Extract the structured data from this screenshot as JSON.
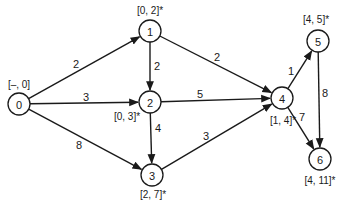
{
  "diagram": {
    "type": "directed-weighted-graph",
    "colors": {
      "ink": "#1a1a1a",
      "background": "#ffffff"
    },
    "nodes": [
      {
        "id": "0",
        "label": "0",
        "tag": "[–, 0]",
        "x": 19,
        "y": 104,
        "tag_x": 19,
        "tag_y": 84
      },
      {
        "id": "1",
        "label": "1",
        "tag": "[0, 2]*",
        "x": 150,
        "y": 31,
        "tag_x": 150,
        "tag_y": 10
      },
      {
        "id": "2",
        "label": "2",
        "tag": "[0, 3]*",
        "x": 150,
        "y": 102,
        "tag_x": 127,
        "tag_y": 116
      },
      {
        "id": "3",
        "label": "3",
        "tag": "[2, 7]*",
        "x": 152,
        "y": 175,
        "tag_x": 153,
        "tag_y": 194
      },
      {
        "id": "4",
        "label": "4",
        "tag": "[1, 4]*",
        "x": 282,
        "y": 98,
        "tag_x": 283,
        "tag_y": 120
      },
      {
        "id": "5",
        "label": "5",
        "tag": "[4, 5]*",
        "x": 318,
        "y": 41,
        "tag_x": 316,
        "tag_y": 19
      },
      {
        "id": "6",
        "label": "6",
        "tag": "[4, 11]*",
        "x": 320,
        "y": 159,
        "tag_x": 320,
        "tag_y": 180
      }
    ],
    "edges": [
      {
        "from": "0",
        "to": "1",
        "weight": "2",
        "wx": 76,
        "wy": 64
      },
      {
        "from": "0",
        "to": "2",
        "weight": "3",
        "wx": 86,
        "wy": 97
      },
      {
        "from": "0",
        "to": "3",
        "weight": "8",
        "wx": 79,
        "wy": 145
      },
      {
        "from": "1",
        "to": "2",
        "weight": "2",
        "wx": 157,
        "wy": 66
      },
      {
        "from": "1",
        "to": "4",
        "weight": "2",
        "wx": 217,
        "wy": 57
      },
      {
        "from": "2",
        "to": "4",
        "weight": "5",
        "wx": 200,
        "wy": 94
      },
      {
        "from": "2",
        "to": "3",
        "weight": "4",
        "wx": 158,
        "wy": 128
      },
      {
        "from": "3",
        "to": "4",
        "weight": "3",
        "wx": 206,
        "wy": 136
      },
      {
        "from": "4",
        "to": "5",
        "weight": "1",
        "wx": 291,
        "wy": 71
      },
      {
        "from": "5",
        "to": "6",
        "weight": "8",
        "wx": 325,
        "wy": 93
      },
      {
        "from": "4",
        "to": "6",
        "weight": "7",
        "wx": 302,
        "wy": 117
      }
    ]
  }
}
